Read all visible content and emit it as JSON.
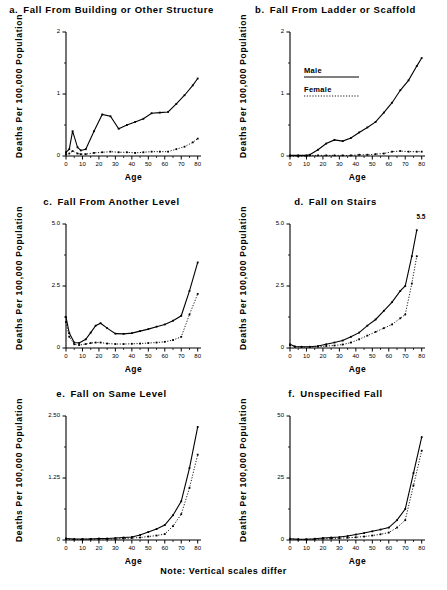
{
  "figure": {
    "note": "Note: Vertical scales differ",
    "axis_labels": {
      "x": "Age",
      "y": "Deaths Per 100,000 Population"
    },
    "legend": {
      "male_label": "Male",
      "female_label": "Female"
    }
  },
  "chart_data": [
    {
      "type": "line",
      "panel": "a",
      "panel_letter": "a.",
      "title": "Fall From Building or Other Structure",
      "xlabel": "Age",
      "ylabel": "Deaths Per 100,000 Population",
      "xlim": [
        0,
        82
      ],
      "ylim": [
        0,
        2
      ],
      "xticks": [
        0,
        10,
        20,
        30,
        40,
        50,
        60,
        70,
        80
      ],
      "xticklabels": [
        "0",
        "10",
        "20",
        "30",
        "40",
        "50",
        "60",
        "70",
        "80"
      ],
      "yticks": [
        0,
        1,
        2
      ],
      "yticklabels": [
        "0",
        "1",
        "2"
      ],
      "grid": false,
      "legend_position": "none",
      "x": [
        0,
        2,
        4,
        7,
        9,
        12,
        17,
        22,
        27,
        32,
        37,
        42,
        47,
        52,
        57,
        62,
        67,
        72,
        77,
        80
      ],
      "series": [
        {
          "name": "Male",
          "style": "solid",
          "values": [
            0.06,
            0.11,
            0.4,
            0.14,
            0.09,
            0.11,
            0.4,
            0.67,
            0.64,
            0.44,
            0.5,
            0.55,
            0.6,
            0.69,
            0.7,
            0.71,
            0.84,
            0.98,
            1.14,
            1.25
          ]
        },
        {
          "name": "Female",
          "style": "dotted",
          "values": [
            0.03,
            0.04,
            0.08,
            0.04,
            0.03,
            0.03,
            0.05,
            0.06,
            0.07,
            0.06,
            0.06,
            0.05,
            0.06,
            0.07,
            0.07,
            0.07,
            0.11,
            0.15,
            0.22,
            0.28
          ]
        }
      ]
    },
    {
      "type": "line",
      "panel": "b",
      "panel_letter": "b.",
      "title": "Fall From Ladder or Scaffold",
      "xlabel": "Age",
      "ylabel": "Deaths Per 100,000 Population",
      "xlim": [
        0,
        82
      ],
      "ylim": [
        0,
        2
      ],
      "xticks": [
        0,
        10,
        20,
        30,
        40,
        50,
        60,
        70,
        80
      ],
      "xticklabels": [
        "0",
        "10",
        "20",
        "30",
        "40",
        "50",
        "60",
        "70",
        "80"
      ],
      "yticks": [
        0,
        1,
        2
      ],
      "yticklabels": [
        "0",
        "1",
        "2"
      ],
      "grid": false,
      "legend_position": "upper-left-inside",
      "x": [
        0,
        5,
        10,
        12,
        17,
        22,
        27,
        32,
        37,
        42,
        47,
        52,
        57,
        62,
        67,
        72,
        77,
        80
      ],
      "series": [
        {
          "name": "Male",
          "style": "solid",
          "values": [
            0.01,
            0.01,
            0.01,
            0.02,
            0.1,
            0.2,
            0.26,
            0.24,
            0.29,
            0.38,
            0.46,
            0.55,
            0.7,
            0.86,
            1.06,
            1.22,
            1.45,
            1.58
          ]
        },
        {
          "name": "Female",
          "style": "dotted",
          "values": [
            0.0,
            0.0,
            0.0,
            0.01,
            0.01,
            0.01,
            0.01,
            0.01,
            0.01,
            0.02,
            0.02,
            0.03,
            0.04,
            0.07,
            0.08,
            0.07,
            0.07,
            0.07
          ]
        }
      ]
    },
    {
      "type": "line",
      "panel": "c",
      "panel_letter": "c.",
      "title": "Fall From Another Level",
      "xlabel": "Age",
      "ylabel": "Deaths Per 100,000 Population",
      "xlim": [
        0,
        82
      ],
      "ylim": [
        0,
        5.0
      ],
      "xticks": [
        0,
        10,
        20,
        30,
        40,
        50,
        60,
        70,
        80
      ],
      "xticklabels": [
        "0",
        "10",
        "20",
        "30",
        "40",
        "50",
        "60",
        "70",
        "80"
      ],
      "yticks": [
        0,
        2.5,
        5.0
      ],
      "yticklabels": [
        "0",
        "2.5",
        "5.0"
      ],
      "grid": false,
      "legend_position": "none",
      "x": [
        0,
        2,
        5,
        8,
        12,
        15,
        18,
        21,
        25,
        30,
        35,
        40,
        45,
        50,
        55,
        60,
        65,
        70,
        75,
        80
      ],
      "series": [
        {
          "name": "Male",
          "style": "solid",
          "values": [
            1.25,
            0.6,
            0.22,
            0.2,
            0.35,
            0.62,
            0.9,
            1.0,
            0.8,
            0.58,
            0.57,
            0.6,
            0.68,
            0.76,
            0.86,
            0.95,
            1.1,
            1.3,
            2.3,
            3.45
          ]
        },
        {
          "name": "Female",
          "style": "dotted",
          "values": [
            1.05,
            0.45,
            0.15,
            0.12,
            0.16,
            0.2,
            0.22,
            0.22,
            0.18,
            0.16,
            0.16,
            0.17,
            0.18,
            0.2,
            0.22,
            0.25,
            0.32,
            0.45,
            1.35,
            2.18
          ]
        }
      ]
    },
    {
      "type": "line",
      "panel": "d",
      "panel_letter": "d.",
      "title": "Fall on Stairs",
      "xlabel": "Age",
      "ylabel": "Deaths Per 100,000 Population",
      "xlim": [
        0,
        82
      ],
      "ylim": [
        0,
        5.0
      ],
      "xticks": [
        0,
        10,
        20,
        30,
        40,
        50,
        60,
        70,
        80
      ],
      "xticklabels": [
        "0",
        "10",
        "20",
        "30",
        "40",
        "50",
        "60",
        "70",
        "80"
      ],
      "yticks": [
        0,
        2.5,
        5.0
      ],
      "yticklabels": [
        "0",
        "2.5",
        "5.0"
      ],
      "grid": false,
      "legend_position": "none",
      "annotations": [
        {
          "text": "5.5",
          "x": 78,
          "y": 5.0
        }
      ],
      "x": [
        0,
        3,
        7,
        12,
        17,
        22,
        27,
        32,
        37,
        42,
        47,
        52,
        57,
        62,
        67,
        70,
        74,
        77
      ],
      "series": [
        {
          "name": "Male",
          "style": "solid",
          "values": [
            0.15,
            0.06,
            0.05,
            0.05,
            0.08,
            0.15,
            0.22,
            0.3,
            0.45,
            0.62,
            0.9,
            1.15,
            1.5,
            1.85,
            2.3,
            2.5,
            3.7,
            4.75
          ]
        },
        {
          "name": "Female",
          "style": "dotted",
          "values": [
            0.12,
            0.05,
            0.04,
            0.04,
            0.05,
            0.08,
            0.1,
            0.14,
            0.22,
            0.35,
            0.5,
            0.65,
            0.8,
            0.95,
            1.2,
            1.35,
            2.6,
            3.7
          ]
        }
      ]
    },
    {
      "type": "line",
      "panel": "e",
      "panel_letter": "e.",
      "title": "Fall on Same Level",
      "xlabel": "Age",
      "ylabel": "Deaths Per 100,000 Population",
      "xlim": [
        0,
        82
      ],
      "ylim": [
        0,
        2.5
      ],
      "xticks": [
        0,
        10,
        20,
        30,
        40,
        50,
        60,
        70,
        80
      ],
      "xticklabels": [
        "0",
        "10",
        "20",
        "30",
        "40",
        "50",
        "60",
        "70",
        "80"
      ],
      "yticks": [
        0,
        1.25,
        2.5
      ],
      "yticklabels": [
        "0",
        "1.25",
        "2.50"
      ],
      "grid": false,
      "legend_position": "none",
      "x": [
        0,
        5,
        10,
        15,
        20,
        25,
        30,
        35,
        40,
        45,
        50,
        55,
        60,
        65,
        70,
        75,
        80
      ],
      "series": [
        {
          "name": "Male",
          "style": "solid",
          "values": [
            0.03,
            0.02,
            0.02,
            0.02,
            0.03,
            0.03,
            0.04,
            0.05,
            0.06,
            0.1,
            0.16,
            0.22,
            0.3,
            0.5,
            0.78,
            1.45,
            2.28
          ]
        },
        {
          "name": "Female",
          "style": "dotted",
          "values": [
            0.02,
            0.01,
            0.01,
            0.02,
            0.02,
            0.02,
            0.02,
            0.03,
            0.04,
            0.05,
            0.07,
            0.09,
            0.12,
            0.28,
            0.52,
            1.05,
            1.72
          ]
        }
      ]
    },
    {
      "type": "line",
      "panel": "f",
      "panel_letter": "f.",
      "title": "Unspecified Fall",
      "xlabel": "Age",
      "ylabel": "Deaths Per 100,000 Population",
      "xlim": [
        0,
        82
      ],
      "ylim": [
        0,
        50
      ],
      "xticks": [
        0,
        10,
        20,
        30,
        40,
        50,
        60,
        70,
        80
      ],
      "xticklabels": [
        "0",
        "10",
        "20",
        "30",
        "40",
        "50",
        "60",
        "70",
        "80"
      ],
      "yticks": [
        0,
        25,
        50
      ],
      "yticklabels": [
        "0",
        "25",
        "50"
      ],
      "grid": false,
      "legend_position": "none",
      "x": [
        0,
        5,
        10,
        15,
        20,
        25,
        30,
        35,
        40,
        45,
        50,
        55,
        60,
        65,
        70,
        75,
        80
      ],
      "series": [
        {
          "name": "Male",
          "style": "solid",
          "values": [
            0.5,
            0.3,
            0.3,
            0.5,
            0.8,
            1.0,
            1.2,
            1.6,
            2.2,
            2.8,
            3.5,
            4.2,
            5.0,
            8.0,
            12.5,
            27.0,
            41.5
          ]
        },
        {
          "name": "Female",
          "style": "dotted",
          "values": [
            0.4,
            0.2,
            0.2,
            0.3,
            0.5,
            0.6,
            0.7,
            0.9,
            1.1,
            1.4,
            1.8,
            2.3,
            3.0,
            5.0,
            8.0,
            22.0,
            36.0
          ]
        }
      ]
    }
  ]
}
